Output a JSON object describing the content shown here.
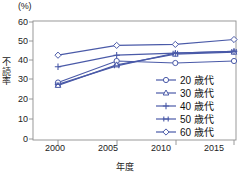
{
  "chart_data": {
    "type": "line",
    "title": "",
    "unit_label": "(%)",
    "xlabel": "年度",
    "ylabel": "不読率",
    "categories": [
      "2000",
      "2005",
      "2010",
      "2015"
    ],
    "x": [
      2000,
      2005,
      2010,
      2015
    ],
    "xlim": [
      1998,
      2017
    ],
    "ylim": [
      0,
      60
    ],
    "yticks": [
      "0",
      "10",
      "20",
      "30",
      "40",
      "50",
      "60"
    ],
    "ytick_values": [
      0,
      10,
      20,
      30,
      40,
      50,
      60
    ],
    "grid": false,
    "legend_position": "lower-right",
    "line_color": "#4a5aa8",
    "series": [
      {
        "name": "20 歳代",
        "legend_label": "20 歳代",
        "marker": "open-circle",
        "values": [
          29.0,
          40.0,
          39.0,
          40.0
        ]
      },
      {
        "name": "30 歳代",
        "legend_label": "30 歳代",
        "marker": "open-triangle",
        "values": [
          27.5,
          38.0,
          43.5,
          44.5
        ]
      },
      {
        "name": "40 歳代",
        "legend_label": "40 歳代",
        "marker": "plus",
        "values": [
          37.0,
          43.0,
          44.0,
          45.0
        ]
      },
      {
        "name": "50 歳代",
        "legend_label": "50 歳代",
        "marker": "asterisk",
        "values": [
          28.0,
          37.5,
          44.0,
          45.0
        ]
      },
      {
        "name": "60 歳代",
        "legend_label": "60 歳代",
        "marker": "open-diamond",
        "values": [
          43.0,
          48.0,
          48.5,
          51.0
        ]
      }
    ]
  },
  "axis": {
    "unit": "(%)",
    "y_title": "不読率",
    "x_title": "年度"
  }
}
